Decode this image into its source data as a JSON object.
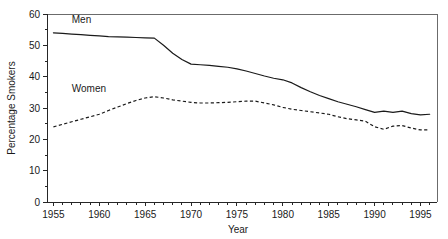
{
  "chart_data": {
    "type": "line",
    "title": "",
    "xlabel": "Year",
    "ylabel": "Percentage Smokers",
    "xlim": [
      1954.3,
      1996.8
    ],
    "ylim": [
      0,
      60
    ],
    "grid": false,
    "legend_position": "inline-annotation",
    "x_ticks_major": [
      1955,
      1960,
      1965,
      1970,
      1975,
      1980,
      1985,
      1990,
      1995
    ],
    "x_tick_labels": [
      "1955",
      "1960",
      "1965",
      "1970",
      "1975",
      "1980",
      "1985",
      "1990",
      "1995"
    ],
    "x_tick_minor_step": 1,
    "y_ticks_major": [
      0,
      10,
      20,
      30,
      40,
      50,
      60
    ],
    "y_tick_labels": [
      "0",
      "10",
      "20",
      "30",
      "40",
      "50",
      "60"
    ],
    "y_tick_minor_step": 5,
    "x": [
      1955,
      1956,
      1957,
      1958,
      1959,
      1960,
      1961,
      1962,
      1963,
      1964,
      1965,
      1966,
      1967,
      1968,
      1969,
      1970,
      1971,
      1972,
      1973,
      1974,
      1975,
      1976,
      1977,
      1978,
      1979,
      1980,
      1981,
      1982,
      1983,
      1984,
      1985,
      1986,
      1987,
      1988,
      1989,
      1990,
      1991,
      1992,
      1993,
      1994,
      1995,
      1996
    ],
    "series": [
      {
        "name": "Men",
        "style": "solid",
        "label": "Men",
        "values": [
          54.0,
          53.8,
          53.6,
          53.4,
          53.2,
          53.0,
          52.8,
          52.7,
          52.6,
          52.5,
          52.4,
          52.3,
          50.0,
          47.5,
          45.5,
          44.0,
          43.8,
          43.6,
          43.3,
          43.0,
          42.5,
          41.8,
          41.0,
          40.2,
          39.5,
          39.0,
          38.0,
          36.5,
          35.2,
          34.0,
          33.0,
          32.0,
          31.2,
          30.4,
          29.5,
          28.6,
          29.0,
          28.6,
          29.0,
          28.2,
          27.8,
          28.0
        ]
      },
      {
        "name": "Women",
        "style": "dashed",
        "label": "Women",
        "values": [
          24.0,
          24.8,
          25.6,
          26.4,
          27.2,
          28.0,
          29.2,
          30.3,
          31.4,
          32.4,
          33.2,
          33.6,
          33.2,
          32.6,
          32.2,
          31.8,
          31.6,
          31.6,
          31.7,
          31.8,
          32.0,
          32.2,
          32.2,
          31.6,
          31.0,
          30.2,
          29.6,
          29.2,
          28.8,
          28.4,
          28.0,
          27.2,
          26.6,
          26.2,
          25.8,
          24.0,
          23.2,
          24.2,
          24.4,
          23.6,
          23.0,
          23.0
        ]
      }
    ],
    "annotations": [
      {
        "text": "Men",
        "x": 1957.0,
        "y": 57.0
      },
      {
        "text": "Women",
        "x": 1957.0,
        "y": 35.2
      }
    ]
  },
  "colors": {
    "line": "#1a1a1a",
    "axis": "#262626",
    "frame": "#6b6b6b",
    "background": "#ffffff"
  }
}
